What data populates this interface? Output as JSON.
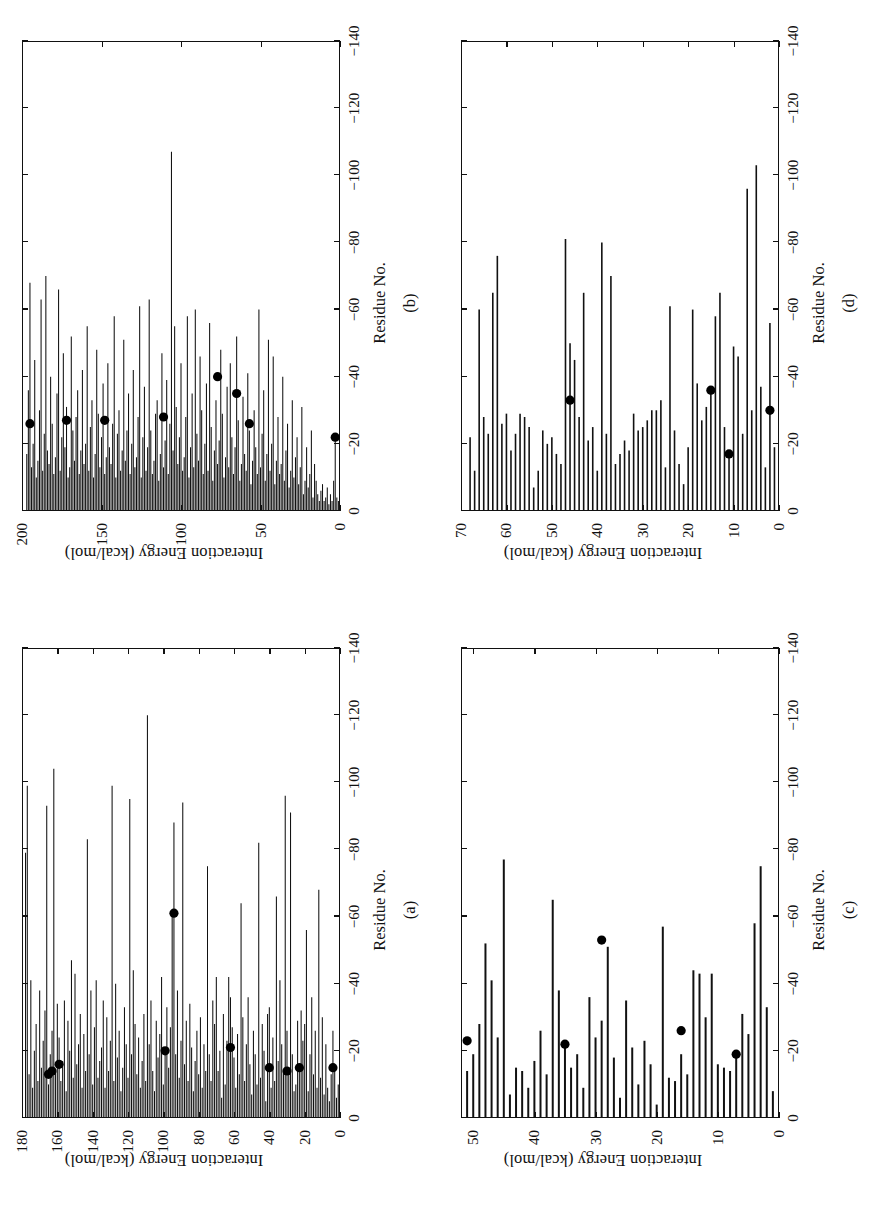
{
  "figure": {
    "axis_labels": {
      "y": "Interaction Energy (kcal/mol)",
      "x": "Residue No."
    },
    "panel_letters": {
      "a": "(a)",
      "b": "(b)",
      "c": "(c)",
      "d": "(d)"
    },
    "y_ticks": [
      "0",
      "−20",
      "−40",
      "−60",
      "−80",
      "−100",
      "−120",
      "−140"
    ],
    "ink_color": "#111111",
    "marker_color": "#000000",
    "background_color": "#ffffff"
  },
  "chart_data": [
    {
      "id": "a",
      "type": "bar",
      "orientation": "horizontal",
      "title": "(a)",
      "xlabel": "Residue No.",
      "ylabel": "Interaction Energy (kcal/mol)",
      "xlim": [
        0,
        180
      ],
      "ylim": [
        -140,
        0
      ],
      "xticks": [
        0,
        20,
        40,
        60,
        80,
        100,
        120,
        140,
        160,
        180
      ],
      "yticks": [
        0,
        -20,
        -40,
        -60,
        -80,
        -100,
        -120,
        -140
      ],
      "grid": false,
      "legend": false,
      "x": [
        1,
        2,
        3,
        4,
        5,
        6,
        7,
        8,
        9,
        10,
        11,
        12,
        13,
        14,
        15,
        16,
        17,
        18,
        19,
        20,
        21,
        22,
        23,
        24,
        25,
        26,
        27,
        28,
        29,
        30,
        31,
        32,
        33,
        34,
        35,
        36,
        37,
        38,
        39,
        40,
        41,
        42,
        43,
        44,
        45,
        46,
        47,
        48,
        49,
        50,
        51,
        52,
        53,
        54,
        55,
        56,
        57,
        58,
        59,
        60,
        61,
        62,
        63,
        64,
        65,
        66,
        67,
        68,
        69,
        70,
        71,
        72,
        73,
        74,
        75,
        76,
        77,
        78,
        79,
        80,
        81,
        82,
        83,
        84,
        85,
        86,
        87,
        88,
        89,
        90,
        91,
        92,
        93,
        94,
        95,
        96,
        97,
        98,
        99,
        100,
        101,
        102,
        103,
        104,
        105,
        106,
        107,
        108,
        109,
        110,
        111,
        112,
        113,
        114,
        115,
        116,
        117,
        118,
        119,
        120,
        121,
        122,
        123,
        124,
        125,
        126,
        127,
        128,
        129,
        130,
        131,
        132,
        133,
        134,
        135,
        136,
        137,
        138,
        139,
        140,
        141,
        142,
        143,
        144,
        145,
        146,
        147,
        148,
        149,
        150,
        151,
        152,
        153,
        154,
        155,
        156,
        157,
        158,
        159,
        160,
        161,
        162,
        163,
        164,
        165,
        166,
        167,
        168,
        169,
        170,
        171,
        172,
        173,
        174,
        175,
        176,
        177,
        178
      ],
      "values": [
        -10,
        -6,
        -14,
        -26,
        -13,
        -5,
        -9,
        -22,
        -7,
        -30,
        -12,
        -68,
        -9,
        -26,
        -13,
        -36,
        -19,
        -8,
        -56,
        -28,
        -23,
        -32,
        -15,
        -29,
        -10,
        -8,
        -19,
        -91,
        -13,
        -26,
        -96,
        -14,
        -22,
        -41,
        -17,
        -66,
        -11,
        -24,
        -9,
        -33,
        -31,
        -5,
        -20,
        -28,
        -12,
        -82,
        -10,
        -19,
        -26,
        -7,
        -16,
        -36,
        -22,
        -11,
        -30,
        -64,
        -13,
        -25,
        -9,
        -18,
        -27,
        -36,
        -42,
        -23,
        -10,
        -31,
        -6,
        -20,
        -14,
        -42,
        -28,
        -35,
        -11,
        -19,
        -75,
        -14,
        -22,
        -9,
        -30,
        -13,
        -26,
        -17,
        -8,
        -21,
        -34,
        -11,
        -29,
        -16,
        -94,
        -23,
        -12,
        -38,
        -19,
        -88,
        -60,
        -27,
        -15,
        -33,
        -21,
        -10,
        -42,
        -25,
        -18,
        -29,
        -8,
        -14,
        -35,
        -22,
        -120,
        -11,
        -31,
        -17,
        -9,
        -24,
        -13,
        -28,
        -44,
        -19,
        -95,
        -12,
        -22,
        -33,
        -15,
        -8,
        -26,
        -18,
        -40,
        -11,
        -99,
        -23,
        -14,
        -30,
        -9,
        -35,
        -21,
        -17,
        -12,
        -41,
        -27,
        -10,
        -38,
        -19,
        -83,
        -14,
        -25,
        -9,
        -31,
        -22,
        -16,
        -43,
        -12,
        -47,
        -20,
        -29,
        -8,
        -35,
        -17,
        -11,
        -24,
        -34,
        -14,
        -104,
        -26,
        -19,
        -10,
        -93,
        -32,
        -23,
        -15,
        -38,
        -11,
        -28,
        -20,
        -9,
        -41,
        -13,
        -99,
        -79,
        -30,
        -22,
        -16,
        -69,
        -36
      ],
      "markers": {
        "x": [
          4,
          23,
          30,
          40,
          62,
          94,
          99,
          159,
          163,
          165
        ],
        "y": [
          -15,
          -15,
          -14,
          -15,
          -21,
          -61,
          -20,
          -16,
          -14,
          -13
        ],
        "style": "filled-circle"
      }
    },
    {
      "id": "b",
      "type": "bar",
      "orientation": "horizontal",
      "title": "(b)",
      "xlabel": "Residue No.",
      "ylabel": "Interaction Energy (kcal/mol)",
      "xlim": [
        0,
        200
      ],
      "ylim": [
        -140,
        0
      ],
      "xticks": [
        0,
        50,
        100,
        150,
        200
      ],
      "yticks": [
        0,
        -20,
        -40,
        -60,
        -80,
        -100,
        -120,
        -140
      ],
      "grid": false,
      "legend": false,
      "x": [
        1,
        2,
        3,
        4,
        5,
        6,
        7,
        8,
        9,
        10,
        11,
        12,
        13,
        14,
        15,
        16,
        17,
        18,
        19,
        20,
        21,
        22,
        23,
        24,
        25,
        26,
        27,
        28,
        29,
        30,
        31,
        32,
        33,
        34,
        35,
        36,
        37,
        38,
        39,
        40,
        41,
        42,
        43,
        44,
        45,
        46,
        47,
        48,
        49,
        50,
        51,
        52,
        53,
        54,
        55,
        56,
        57,
        58,
        59,
        60,
        61,
        62,
        63,
        64,
        65,
        66,
        67,
        68,
        69,
        70,
        71,
        72,
        73,
        74,
        75,
        76,
        77,
        78,
        79,
        80,
        81,
        82,
        83,
        84,
        85,
        86,
        87,
        88,
        89,
        90,
        91,
        92,
        93,
        94,
        95,
        96,
        97,
        98,
        99,
        100,
        101,
        102,
        103,
        104,
        105,
        106,
        107,
        108,
        109,
        110,
        111,
        112,
        113,
        114,
        115,
        116,
        117,
        118,
        119,
        120,
        121,
        122,
        123,
        124,
        125,
        126,
        127,
        128,
        129,
        130,
        131,
        132,
        133,
        134,
        135,
        136,
        137,
        138,
        139,
        140,
        141,
        142,
        143,
        144,
        145,
        146,
        147,
        148,
        149,
        150,
        151,
        152,
        153,
        154,
        155,
        156,
        157,
        158,
        159,
        160,
        161,
        162,
        163,
        164,
        165,
        166,
        167,
        168,
        169,
        170,
        171,
        172,
        173,
        174,
        175,
        176,
        177,
        178,
        179,
        180,
        181,
        182,
        183,
        184,
        185,
        186,
        187,
        188,
        189,
        190,
        191,
        192,
        193,
        194,
        195,
        196,
        197,
        198,
        199
      ],
      "values": [
        -3,
        -4,
        -22,
        -9,
        -3,
        -5,
        -2,
        -7,
        -4,
        -3,
        -8,
        -6,
        -3,
        -5,
        -9,
        -14,
        -4,
        -24,
        -11,
        -7,
        -19,
        -9,
        -5,
        -31,
        -13,
        -8,
        -22,
        -16,
        -10,
        -33,
        -12,
        -7,
        -26,
        -18,
        -9,
        -40,
        -14,
        -11,
        -28,
        -15,
        -8,
        -46,
        -20,
        -12,
        -51,
        -17,
        -9,
        -36,
        -23,
        -13,
        -60,
        -11,
        -19,
        -30,
        -15,
        -8,
        -24,
        -41,
        -12,
        -17,
        -34,
        -14,
        -9,
        -27,
        -52,
        -19,
        -11,
        -22,
        -44,
        -13,
        -37,
        -16,
        -10,
        -29,
        -48,
        -21,
        -14,
        -33,
        -18,
        -9,
        -25,
        -56,
        -12,
        -38,
        -20,
        -11,
        -30,
        -46,
        -15,
        -23,
        -60,
        -13,
        -35,
        -19,
        -10,
        -58,
        -28,
        -16,
        -12,
        -44,
        -22,
        -14,
        -31,
        -55,
        -18,
        -107,
        -26,
        -11,
        -39,
        -21,
        -13,
        -47,
        -17,
        -9,
        -33,
        -29,
        -15,
        -11,
        -24,
        -63,
        -19,
        -12,
        -37,
        -22,
        -10,
        -61,
        -28,
        -16,
        -13,
        -42,
        -20,
        -11,
        -35,
        -24,
        -15,
        -51,
        -18,
        -12,
        -30,
        -23,
        -10,
        -58,
        -26,
        -14,
        -19,
        -44,
        -16,
        -11,
        -38,
        -22,
        -13,
        -29,
        -48,
        -17,
        -10,
        -33,
        -25,
        -12,
        -55,
        -20,
        -14,
        -42,
        -18,
        -11,
        -36,
        -28,
        -15,
        -24,
        -52,
        -13,
        -10,
        -31,
        -19,
        -47,
        -22,
        -12,
        -66,
        -35,
        -16,
        -11,
        -26,
        -40,
        -14,
        -18,
        -70,
        -23,
        -12,
        -63,
        -30,
        -15,
        -10,
        -45,
        -20,
        -13,
        -68,
        -36,
        -17
      ],
      "markers": {
        "x": [
          3,
          57,
          65,
          77,
          111,
          148,
          172,
          195
        ],
        "y": [
          -22,
          -26,
          -35,
          -40,
          -28,
          -27,
          -27,
          -26
        ],
        "style": "filled-circle"
      }
    },
    {
      "id": "c",
      "type": "bar",
      "orientation": "horizontal",
      "title": "(c)",
      "xlabel": "Residue No.",
      "ylabel": "Interaction Energy (kcal/mol)",
      "xlim": [
        0,
        52
      ],
      "ylim": [
        -140,
        0
      ],
      "xticks": [
        0,
        10,
        20,
        30,
        40,
        50
      ],
      "yticks": [
        0,
        -20,
        -40,
        -60,
        -80,
        -100,
        -120,
        -140
      ],
      "grid": false,
      "legend": false,
      "x": [
        1,
        2,
        3,
        4,
        5,
        6,
        7,
        8,
        9,
        10,
        11,
        12,
        13,
        14,
        15,
        16,
        17,
        18,
        19,
        20,
        21,
        22,
        23,
        24,
        25,
        26,
        27,
        28,
        29,
        30,
        31,
        32,
        33,
        34,
        35,
        36,
        37,
        38,
        39,
        40,
        41,
        42,
        43,
        44,
        45,
        46,
        47,
        48,
        49,
        50,
        51,
        52
      ],
      "values": [
        -8,
        -33,
        -75,
        -58,
        -25,
        -31,
        -18,
        -14,
        -15,
        -16,
        -43,
        -30,
        -43,
        -44,
        -13,
        -19,
        -11,
        -12,
        -57,
        -4,
        -16,
        -23,
        -10,
        -21,
        -35,
        -6,
        -18,
        -51,
        -29,
        -24,
        -36,
        -9,
        -19,
        -15,
        -22,
        -38,
        -65,
        -13,
        -26,
        -17,
        -9,
        -14,
        -15,
        -7,
        -77,
        -24,
        -41,
        -52,
        -28,
        -19,
        -14,
        -11
      ],
      "markers": {
        "x": [
          7,
          16,
          29,
          35,
          51
        ],
        "y": [
          -19,
          -26,
          -53,
          -22,
          -23
        ],
        "style": "filled-circle"
      }
    },
    {
      "id": "d",
      "type": "bar",
      "orientation": "horizontal",
      "title": "(d)",
      "xlabel": "Residue No.",
      "ylabel": "Interaction Energy (kcal/mol)",
      "xlim": [
        0,
        70
      ],
      "ylim": [
        -140,
        0
      ],
      "xticks": [
        0,
        10,
        20,
        30,
        40,
        50,
        60,
        70
      ],
      "yticks": [
        0,
        -20,
        -40,
        -60,
        -80,
        -100,
        -120,
        -140
      ],
      "grid": false,
      "legend": false,
      "x": [
        1,
        2,
        3,
        4,
        5,
        6,
        7,
        8,
        9,
        10,
        11,
        12,
        13,
        14,
        15,
        16,
        17,
        18,
        19,
        20,
        21,
        22,
        23,
        24,
        25,
        26,
        27,
        28,
        29,
        30,
        31,
        32,
        33,
        34,
        35,
        36,
        37,
        38,
        39,
        40,
        41,
        42,
        43,
        44,
        45,
        46,
        47,
        48,
        49,
        50,
        51,
        52,
        53,
        54,
        55,
        56,
        57,
        58,
        59,
        60,
        61,
        62,
        63,
        64,
        65,
        66,
        67,
        68
      ],
      "values": [
        -19,
        -56,
        -13,
        -37,
        -103,
        -30,
        -96,
        -23,
        -46,
        -49,
        -17,
        -25,
        -65,
        -58,
        -35,
        -31,
        -27,
        -38,
        -60,
        -19,
        -8,
        -14,
        -24,
        -61,
        -13,
        -33,
        -30,
        -30,
        -27,
        -25,
        -24,
        -29,
        -18,
        -21,
        -17,
        -14,
        -70,
        -23,
        -80,
        -12,
        -25,
        -21,
        -65,
        -28,
        -45,
        -50,
        -81,
        -14,
        -17,
        -22,
        -20,
        -24,
        -12,
        -7,
        -25,
        -28,
        -29,
        -23,
        -18,
        -29,
        -26,
        -76,
        -65,
        -23,
        -28,
        -60,
        -12,
        -22
      ],
      "markers": {
        "x": [
          2,
          11,
          15,
          46
        ],
        "y": [
          -30,
          -17,
          -36,
          -33
        ],
        "style": "filled-circle"
      }
    }
  ]
}
